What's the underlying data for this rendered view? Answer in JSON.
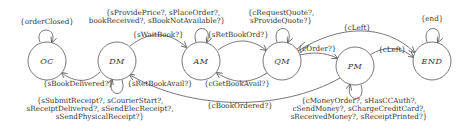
{
  "diagram": {
    "type": "state-machine",
    "states": [
      {
        "id": "OC",
        "label": "OC",
        "cx": 47,
        "cy": 61
      },
      {
        "id": "DM",
        "label": "DM",
        "cx": 117,
        "cy": 61
      },
      {
        "id": "AM",
        "label": "AM",
        "cx": 201,
        "cy": 61
      },
      {
        "id": "QM",
        "label": "QM",
        "cx": 282,
        "cy": 61
      },
      {
        "id": "PM",
        "label": "PM",
        "cx": 355,
        "cy": 66
      },
      {
        "id": "END",
        "label": "END",
        "cx": 432,
        "cy": 61
      }
    ],
    "labels": {
      "oc_loop": "{orderClosed}",
      "dm_to_am_top_1": "{sProvidePrice?, sPlaceOrder?,",
      "dm_to_am_top_2": "bookReceived?, sBookNotAvailable?}",
      "dm_to_am": "{sWaitBook?}",
      "am_loop": "{sRetBookOrd?}",
      "qm_loop_1": "{cRequestQuote?,",
      "qm_loop_2": "sProvideQuote?}",
      "qm_to_end": "{cLeft}",
      "end_loop": "{end}",
      "qm_to_pm": "{cOrder?}",
      "pm_to_end": "{cLeft}",
      "dm_to_oc": "{sBookDelivered?}",
      "dm_loop": "{sRetBookAvail?}",
      "qm_to_am": "{cGetBookAvail?}",
      "pm_to_dm": "{cBookOrdered?}",
      "dm_loop_bottom_1": "{sSubmitReceipt?, sCourierStart?,",
      "dm_loop_bottom_2": "sReceiptDelivered?, sSendElecReceipt?,",
      "dm_loop_bottom_3": "sSendPhysicalReceipt?}",
      "pm_loop_1": "{cMoneyOrder?, sHasCCAuth?,",
      "pm_loop_2": "cSendMoney?, sChargeCreditCard?,",
      "pm_loop_3": "sReceivedMoney?, sReceiptPrinted?}"
    },
    "transitions": [
      {
        "from": "OC",
        "to": "OC",
        "label": "{orderClosed}"
      },
      {
        "from": "DM",
        "to": "OC",
        "label": "{sBookDelivered?}"
      },
      {
        "from": "DM",
        "to": "DM",
        "label": "{sRetBookAvail?}"
      },
      {
        "from": "DM",
        "to": "AM",
        "label": "{sWaitBook?}"
      },
      {
        "from": "AM",
        "to": "AM",
        "label": "{sRetBookOrd?}"
      },
      {
        "from": "AM",
        "to": "QM",
        "label": ""
      },
      {
        "from": "QM",
        "to": "AM",
        "label": "{cGetBookAvail?}"
      },
      {
        "from": "QM",
        "to": "QM",
        "label": "{cRequestQuote?, sProvideQuote?}"
      },
      {
        "from": "QM",
        "to": "PM",
        "label": "{cOrder?}"
      },
      {
        "from": "QM",
        "to": "END",
        "label": "{cLeft}"
      },
      {
        "from": "PM",
        "to": "END",
        "label": "{cLeft}"
      },
      {
        "from": "PM",
        "to": "PM",
        "label": "{cMoneyOrder?, sHasCCAuth?, cSendMoney?, sChargeCreditCard?, sReceivedMoney?, sReceiptPrinted?}"
      },
      {
        "from": "PM",
        "to": "DM",
        "label": "{cBookOrdered?}"
      },
      {
        "from": "END",
        "to": "END",
        "label": "{end}"
      }
    ]
  }
}
